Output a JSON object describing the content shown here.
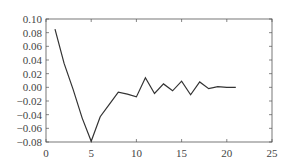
{
  "chart_data": {
    "type": "line",
    "title": "",
    "xlabel": "",
    "ylabel": "",
    "xlim": [
      0,
      25
    ],
    "ylim": [
      -0.08,
      0.1
    ],
    "grid": false,
    "legend": null,
    "x_ticks": [
      "0",
      "5",
      "10",
      "15",
      "20",
      "25"
    ],
    "y_ticks": [
      "0.10",
      "0.08",
      "0.06",
      "0.04",
      "0.02",
      "0.00",
      "-0.02",
      "-0.04",
      "-0.06",
      "-0.08"
    ],
    "series": [
      {
        "name": "series-1",
        "color": "#333333",
        "x": [
          1,
          2,
          3,
          4,
          5,
          6,
          7,
          8,
          9,
          10,
          11,
          12,
          13,
          14,
          15,
          16,
          17,
          18,
          19,
          20,
          21
        ],
        "values": [
          0.085,
          0.035,
          -0.003,
          -0.045,
          -0.079,
          -0.043,
          -0.025,
          -0.007,
          -0.01,
          -0.014,
          0.014,
          -0.009,
          0.005,
          -0.005,
          0.009,
          -0.011,
          0.008,
          -0.002,
          0.001,
          0.0,
          0.0
        ]
      }
    ]
  }
}
